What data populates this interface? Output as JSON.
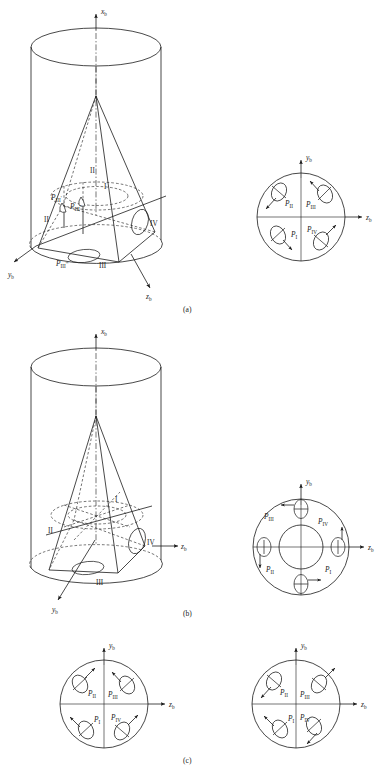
{
  "figure": {
    "title_caption_a": "(a)",
    "title_caption_b": "(b)",
    "title_caption_c": "(c)",
    "line_color": "#1a1a1a",
    "background": "#ffffff"
  },
  "axes": {
    "x_label": "x",
    "y_label": "y",
    "z_label": "z",
    "subscript": "b"
  },
  "panel_a": {
    "caption": "(a)",
    "solid_labels": {
      "p3_prime": "P",
      "p3_prime_sub": "III",
      "p3_prime_mark": "'",
      "p3_dprime_mark": "''",
      "p3_tprime_mark": "'''"
    },
    "roman": [
      "I",
      "II",
      "III",
      "IV"
    ],
    "circle": {
      "axis_vertical": "y",
      "axis_horizontal": "z",
      "subscript": "b",
      "cones": [
        {
          "name": "P",
          "sub": "II",
          "quadrant": "upper-left",
          "arrow": "down-left"
        },
        {
          "name": "P",
          "sub": "III",
          "quadrant": "upper-right",
          "arrow": "up-left"
        },
        {
          "name": "P",
          "sub": "I",
          "quadrant": "lower-left",
          "arrow": "down-right"
        },
        {
          "name": "P",
          "sub": "IV",
          "quadrant": "lower-right",
          "arrow": "up-right"
        }
      ]
    }
  },
  "panel_b": {
    "caption": "(b)",
    "roman": [
      "I",
      "II",
      "III",
      "IV"
    ],
    "circle": {
      "axis_vertical": "y",
      "axis_horizontal": "z",
      "subscript": "b",
      "has_inner_circle": true,
      "cones": [
        {
          "name": "P",
          "sub": "III",
          "position": "top",
          "arrow": "left"
        },
        {
          "name": "P",
          "sub": "IV",
          "position": "right",
          "arrow": "up"
        },
        {
          "name": "P",
          "sub": "II",
          "position": "left",
          "arrow": "down"
        },
        {
          "name": "P",
          "sub": "I",
          "position": "bottom",
          "arrow": "right"
        }
      ]
    }
  },
  "panel_c": {
    "caption": "(c)",
    "circle_left": {
      "axis_vertical": "y",
      "axis_horizontal": "z",
      "subscript": "b",
      "cones": [
        {
          "name": "P",
          "sub": "II",
          "quadrant": "upper-left",
          "arrow": "up-right"
        },
        {
          "name": "P",
          "sub": "III",
          "quadrant": "upper-right",
          "arrow": "up-left"
        },
        {
          "name": "P",
          "sub": "I",
          "quadrant": "lower-left",
          "arrow": "up-left"
        },
        {
          "name": "P",
          "sub": "IV",
          "quadrant": "lower-right",
          "arrow": "up-right"
        }
      ]
    },
    "circle_right": {
      "axis_vertical": "y",
      "axis_horizontal": "z",
      "subscript": "b",
      "cones": [
        {
          "name": "P",
          "sub": "II",
          "quadrant": "upper-left",
          "arrow": "down-left"
        },
        {
          "name": "P",
          "sub": "III",
          "quadrant": "upper-right",
          "arrow": "up-right"
        },
        {
          "name": "P",
          "sub": "I",
          "quadrant": "lower-left",
          "arrow": "up-left"
        },
        {
          "name": "P",
          "sub": "IV",
          "quadrant": "lower-right",
          "arrow": "down-right"
        }
      ]
    }
  }
}
